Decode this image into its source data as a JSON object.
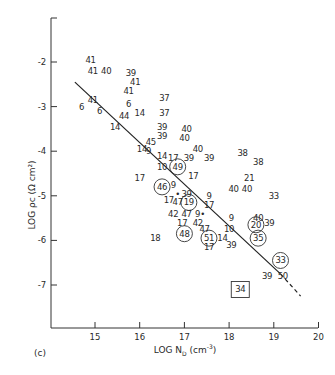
{
  "chart_data": {
    "type": "scatter",
    "title": "",
    "panel_label": "(c)",
    "xlabel": "LOG N_D (cm^-3)",
    "ylabel": "LOG ρc (Ω cm²)",
    "xlim": [
      14.0,
      20.0
    ],
    "ylim": [
      -7.9,
      -1.0
    ],
    "x_ticks": [
      "15",
      "16",
      "17",
      "18",
      "19",
      "20"
    ],
    "y_ticks": [
      "-2",
      "-3",
      "-4",
      "-5",
      "-6",
      "-7"
    ],
    "grid": false,
    "legend": null,
    "fit_line": {
      "solid": [
        [
          14.55,
          -2.45
        ],
        [
          19.15,
          -6.75
        ]
      ],
      "dashed": [
        [
          19.15,
          -6.75
        ],
        [
          19.6,
          -7.25
        ]
      ]
    },
    "points": [
      {
        "label": "41",
        "x": 14.9,
        "y": -1.95
      },
      {
        "label": "41",
        "x": 14.95,
        "y": -2.2
      },
      {
        "label": "40",
        "x": 15.25,
        "y": -2.2
      },
      {
        "label": "39",
        "x": 15.8,
        "y": -2.25
      },
      {
        "label": "41",
        "x": 15.9,
        "y": -2.45
      },
      {
        "label": "41",
        "x": 15.75,
        "y": -2.65
      },
      {
        "label": "41",
        "x": 14.95,
        "y": -2.85
      },
      {
        "label": "6",
        "x": 14.7,
        "y": -3.0
      },
      {
        "label": "6",
        "x": 15.1,
        "y": -3.1
      },
      {
        "label": "6",
        "x": 15.75,
        "y": -2.95
      },
      {
        "label": "44",
        "x": 15.65,
        "y": -3.2
      },
      {
        "label": "14",
        "x": 16.0,
        "y": -3.15
      },
      {
        "label": "37",
        "x": 16.55,
        "y": -2.8
      },
      {
        "label": "37",
        "x": 16.55,
        "y": -3.15
      },
      {
        "label": "14",
        "x": 15.45,
        "y": -3.45
      },
      {
        "label": "39",
        "x": 16.5,
        "y": -3.45
      },
      {
        "label": "39",
        "x": 16.5,
        "y": -3.65
      },
      {
        "label": "40",
        "x": 17.05,
        "y": -3.5
      },
      {
        "label": "40",
        "x": 17.0,
        "y": -3.7
      },
      {
        "label": "45",
        "x": 16.25,
        "y": -3.8
      },
      {
        "label": "14",
        "x": 16.05,
        "y": -3.95
      },
      {
        "label": "9",
        "x": 16.2,
        "y": -4.0
      },
      {
        "label": "40",
        "x": 17.3,
        "y": -3.95
      },
      {
        "label": "14",
        "x": 16.5,
        "y": -4.1
      },
      {
        "label": "17",
        "x": 16.75,
        "y": -4.15
      },
      {
        "label": "39",
        "x": 17.1,
        "y": -4.15
      },
      {
        "label": "39",
        "x": 17.55,
        "y": -4.15
      },
      {
        "label": "38",
        "x": 18.3,
        "y": -4.05
      },
      {
        "label": "38",
        "x": 18.65,
        "y": -4.25
      },
      {
        "label": "10",
        "x": 16.5,
        "y": -4.35
      },
      {
        "label": "49",
        "x": 16.85,
        "y": -4.35,
        "marker": "circle"
      },
      {
        "label": "17",
        "x": 16.0,
        "y": -4.6
      },
      {
        "label": "17",
        "x": 17.2,
        "y": -4.55
      },
      {
        "label": "21",
        "x": 18.45,
        "y": -4.6
      },
      {
        "label": "46",
        "x": 16.5,
        "y": -4.8,
        "marker": "circle"
      },
      {
        "label": "9",
        "x": 16.75,
        "y": -4.75
      },
      {
        "label": "40",
        "x": 18.1,
        "y": -4.85
      },
      {
        "label": "40",
        "x": 18.4,
        "y": -4.85
      },
      {
        "label": "33",
        "x": 19.0,
        "y": -5.0
      },
      {
        "label": "•",
        "x": 16.85,
        "y": -4.95
      },
      {
        "label": "39",
        "x": 17.05,
        "y": -4.95
      },
      {
        "label": "9",
        "x": 17.55,
        "y": -5.0
      },
      {
        "label": "17",
        "x": 16.65,
        "y": -5.1
      },
      {
        "label": "47",
        "x": 16.85,
        "y": -5.15
      },
      {
        "label": "19",
        "x": 17.1,
        "y": -5.15,
        "marker": "circle"
      },
      {
        "label": "17",
        "x": 17.55,
        "y": -5.2
      },
      {
        "label": "42",
        "x": 16.75,
        "y": -5.4
      },
      {
        "label": "47",
        "x": 17.05,
        "y": -5.4
      },
      {
        "label": "9•",
        "x": 17.35,
        "y": -5.4
      },
      {
        "label": "9",
        "x": 18.05,
        "y": -5.5
      },
      {
        "label": "40",
        "x": 18.65,
        "y": -5.5
      },
      {
        "label": "17",
        "x": 16.95,
        "y": -5.6
      },
      {
        "label": "42",
        "x": 17.3,
        "y": -5.6
      },
      {
        "label": "20",
        "x": 18.6,
        "y": -5.65,
        "marker": "circle"
      },
      {
        "label": "39",
        "x": 18.9,
        "y": -5.6
      },
      {
        "label": "47",
        "x": 17.45,
        "y": -5.75
      },
      {
        "label": "10",
        "x": 18.0,
        "y": -5.75
      },
      {
        "label": "48",
        "x": 17.0,
        "y": -5.85,
        "marker": "circle"
      },
      {
        "label": "18",
        "x": 16.35,
        "y": -5.95
      },
      {
        "label": "51",
        "x": 17.55,
        "y": -5.95,
        "marker": "circle"
      },
      {
        "label": "14",
        "x": 17.85,
        "y": -5.95
      },
      {
        "label": "35",
        "x": 18.65,
        "y": -5.95,
        "marker": "circle"
      },
      {
        "label": "17",
        "x": 17.55,
        "y": -6.15
      },
      {
        "label": "39",
        "x": 18.05,
        "y": -6.1
      },
      {
        "label": "33",
        "x": 19.15,
        "y": -6.45,
        "marker": "circle"
      },
      {
        "label": "39",
        "x": 18.85,
        "y": -6.8
      },
      {
        "label": "50",
        "x": 19.2,
        "y": -6.8
      },
      {
        "label": "34",
        "x": 18.25,
        "y": -7.1,
        "marker": "square"
      }
    ]
  }
}
